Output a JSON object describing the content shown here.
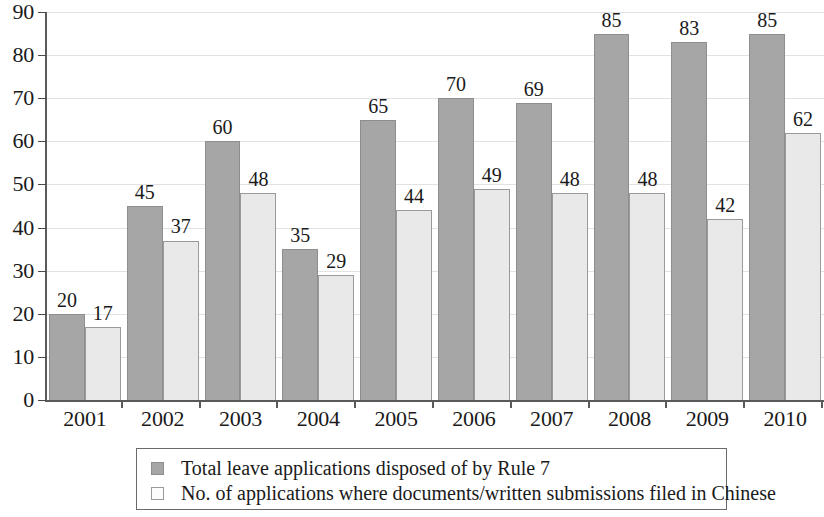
{
  "chart_data": {
    "type": "bar",
    "title": "",
    "subtitle": "",
    "xlabel": "",
    "ylabel": "",
    "categories": [
      "2001",
      "2002",
      "2003",
      "2004",
      "2005",
      "2006",
      "2007",
      "2008",
      "2009",
      "2010"
    ],
    "series": [
      {
        "name": "Total leave applications disposed of by Rule 7",
        "color": "#a6a6a6",
        "values": [
          20,
          45,
          60,
          35,
          65,
          70,
          69,
          85,
          83,
          85
        ]
      },
      {
        "name": "No. of applications where documents/written submissions filed in Chinese",
        "color": "#e9e9e9",
        "values": [
          17,
          37,
          48,
          29,
          44,
          49,
          48,
          48,
          42,
          62
        ]
      }
    ],
    "ylim": [
      0,
      90
    ],
    "ytick_step": 10,
    "yticks": [
      "0",
      "10",
      "20",
      "30",
      "40",
      "50",
      "60",
      "70",
      "80",
      "90"
    ],
    "grid": true,
    "data_labels": true,
    "legend_position": "bottom"
  },
  "legend": {
    "items": [
      {
        "label": "Total leave applications disposed of by Rule 7",
        "swatch": "dark"
      },
      {
        "label": "No. of applications where documents/written submissions filed in Chinese",
        "swatch": "light"
      }
    ]
  }
}
